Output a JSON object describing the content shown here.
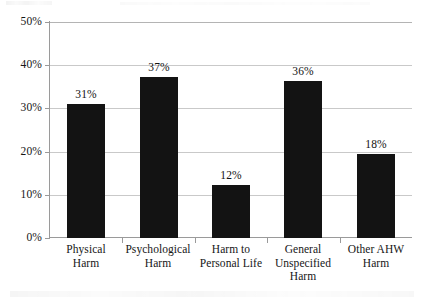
{
  "chart_data": {
    "type": "bar",
    "title": "",
    "subtitle": "",
    "xlabel": "",
    "ylabel": "",
    "categories": [
      "Physical Harm",
      "Psychological Harm",
      "Harm to Personal Life",
      "General Unspecified Harm",
      "Other AHW Harm"
    ],
    "category_lines": [
      [
        "Physical",
        "Harm"
      ],
      [
        "Psychological",
        "Harm"
      ],
      [
        "Harm to",
        "Personal Life"
      ],
      [
        "General",
        "Unspecified",
        "Harm"
      ],
      [
        "Other AHW",
        "Harm"
      ]
    ],
    "values": [
      31,
      37,
      12,
      36,
      18
    ],
    "value_labels": [
      "31%",
      "37%",
      "12%",
      "36%",
      "18%"
    ],
    "plotted_values": [
      31.0,
      37.2,
      12.2,
      36.4,
      19.4
    ],
    "ylim": [
      0,
      50
    ],
    "ytick_values": [
      0,
      10,
      20,
      30,
      40,
      50
    ],
    "ytick_labels": [
      "0%",
      "10%",
      "20%",
      "30%",
      "40%",
      "50%"
    ],
    "grid": true,
    "grid_axis": "y",
    "legend": null,
    "legend_position": "none",
    "bar_color": "#131313",
    "grid_color": "#c9c9c9",
    "axis_color": "#9a9a9a",
    "background_color": "#ffffff",
    "unit": "percent"
  }
}
